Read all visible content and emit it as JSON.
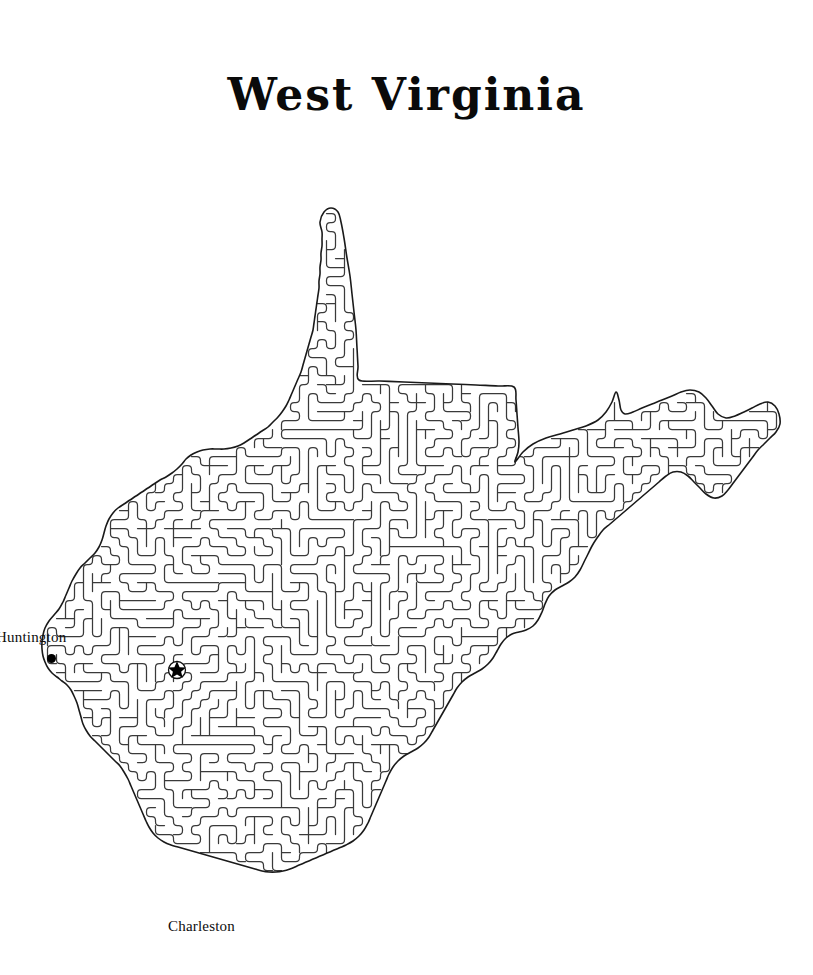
{
  "page": {
    "title": "West Virginia",
    "background_color": "#ffffff",
    "ink_color": "#2b2b2b",
    "width": 813,
    "height": 975
  },
  "map": {
    "kind": "maze-puzzle",
    "subject": "West Virginia",
    "state_name": "West Virginia",
    "outline_color": "#1a1a1a",
    "maze_line_color": "#3a3a3a",
    "fill_color": "#ffffff",
    "description": "Outline of the state of West Virginia filled with a dense winding maze pattern"
  },
  "markers": {
    "capital": {
      "name": "Charleston",
      "symbol": "star",
      "x": 177,
      "y": 670
    },
    "cities": [
      {
        "name": "Huntington",
        "symbol": "dot",
        "label_x": -4,
        "label_y": 629,
        "dot_x": 52,
        "dot_y": 659
      },
      {
        "name": "Charleston",
        "symbol": "star",
        "label_x": 168,
        "label_y": 918,
        "dot_x": 177,
        "dot_y": 670
      }
    ]
  },
  "labels": {
    "huntington": "Huntington",
    "charleston": "Charleston"
  }
}
